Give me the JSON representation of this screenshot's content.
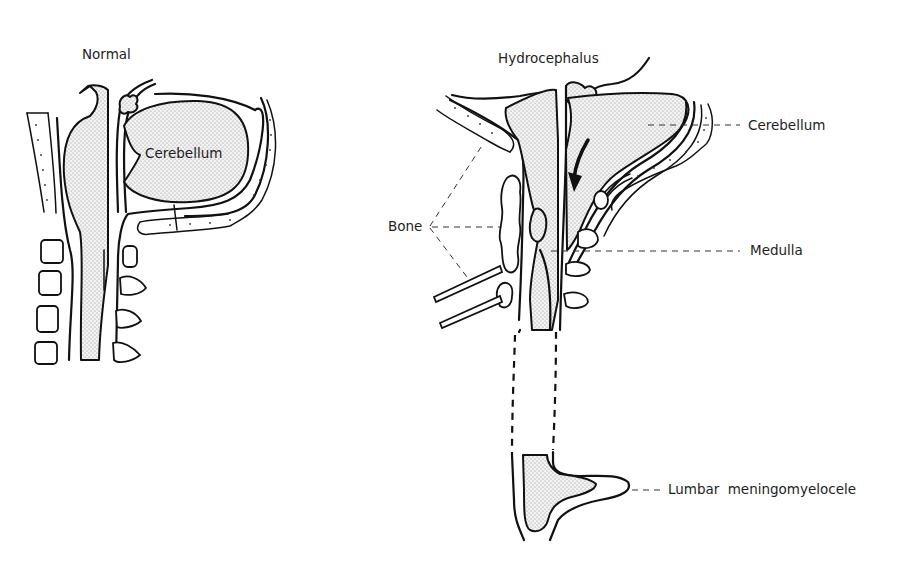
{
  "figure": {
    "panels": [
      {
        "id": "normal",
        "title": "Normal",
        "labels": [
          "Cerebellum"
        ]
      },
      {
        "id": "hydrocephalus",
        "title": "Hydrocephalus",
        "labels": [
          "Cerebellum",
          "Medulla",
          "Bone",
          "Lumbar meningomyelocele"
        ]
      }
    ]
  },
  "normal": {
    "title": "Normal",
    "cerebellum_label": "Cerebellum"
  },
  "hydrocephalus": {
    "title": "Hydrocephalus",
    "cerebellum_label": "Cerebellum",
    "medulla_label": "Medulla",
    "bone_label": "Bone",
    "meningomyelocele_label": "Lumbar meningomyelocele"
  },
  "colors": {
    "ink": "#111111",
    "background": "#ffffff",
    "stipple": "#9a9a9a"
  }
}
